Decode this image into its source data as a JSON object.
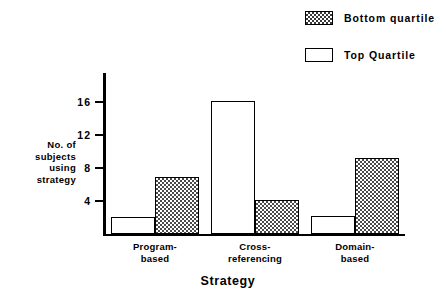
{
  "legend": {
    "items": [
      {
        "label": "Bottom quartile",
        "swatch": "checkered-swatch-icon"
      },
      {
        "label": "Top  Quartile",
        "swatch": "open-swatch-icon"
      }
    ]
  },
  "axes": {
    "y_title_lines": [
      "No. of",
      "subjects",
      "using",
      "strategy"
    ],
    "y_ticks": [
      "4",
      "8",
      "12",
      "16"
    ],
    "x_title": "Strategy"
  },
  "categories_display": [
    [
      "Program-",
      "based"
    ],
    [
      "Cross-",
      "referencing"
    ],
    [
      "Domain-",
      "based"
    ]
  ],
  "chart_data": {
    "type": "bar",
    "title": "",
    "subtitle": "",
    "xlabel": "Strategy",
    "ylabel": "No. of subjects using strategy",
    "categories": [
      "Program-based",
      "Cross-referencing",
      "Domain-based"
    ],
    "series": [
      {
        "name": "Top  Quartile",
        "values": [
          2.0,
          16.1,
          2.1
        ]
      },
      {
        "name": "Bottom quartile",
        "values": [
          6.9,
          4.1,
          9.2
        ]
      }
    ],
    "ylim": [
      0,
      19.5
    ],
    "yticks": [
      4,
      8,
      12,
      16
    ],
    "grid": false,
    "legend_position": "top-right",
    "bar_fill": {
      "Top  Quartile": "white-outline",
      "Bottom quartile": "checkered-grey"
    },
    "colors": {
      "outline": "#000000",
      "fill_pattern": "#4a4a4a",
      "background": "#ffffff"
    }
  }
}
